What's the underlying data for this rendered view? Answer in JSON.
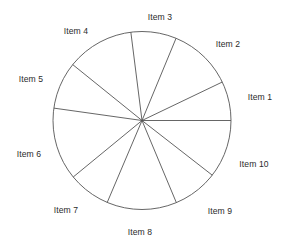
{
  "chart_data": {
    "type": "pie",
    "title": "",
    "subtitle": "",
    "xlabel": "",
    "ylabel": "",
    "legend_position": "none",
    "grid": false,
    "labels_outside": true,
    "stroke_color": "#555555",
    "fill_color": "#ffffff",
    "background": "#ffffff",
    "center": {
      "x": 142,
      "y": 120.5
    },
    "radius": 89,
    "start_angle_deg": 0,
    "direction": "counterclockwise",
    "categories": [
      "Item 1",
      "Item 2",
      "Item 3",
      "Item 4",
      "Item 5",
      "Item 6",
      "Item 7",
      "Item 8",
      "Item 9",
      "Item 10"
    ],
    "values": [
      7.1,
      11.6,
      8.2,
      12.2,
      8.6,
      13.2,
      7.7,
      12.7,
      8.2,
      10.5
    ],
    "slice_angles_deg": [
      25.6,
      41.9,
      29.7,
      43.9,
      30.9,
      47.4,
      27.6,
      45.7,
      29.4,
      37.9
    ],
    "boundary_angles_deg": [
      0,
      25.6,
      67.5,
      97.2,
      141.1,
      172.0,
      219.4,
      247.0,
      292.7,
      322.1,
      360
    ],
    "slices": [
      {
        "label": "Item 1",
        "start_deg": 0,
        "end_deg": 25.6,
        "value": 7.1,
        "label_x": 260,
        "label_y": 97
      },
      {
        "label": "Item 2",
        "start_deg": 25.6,
        "end_deg": 67.5,
        "value": 11.6,
        "label_x": 228,
        "label_y": 44
      },
      {
        "label": "Item 3",
        "start_deg": 67.5,
        "end_deg": 97.2,
        "value": 8.2,
        "label_x": 160,
        "label_y": 17
      },
      {
        "label": "Item 4",
        "start_deg": 97.2,
        "end_deg": 141.1,
        "value": 12.2,
        "label_x": 76,
        "label_y": 31
      },
      {
        "label": "Item 5",
        "start_deg": 141.1,
        "end_deg": 172.0,
        "value": 8.6,
        "label_x": 31,
        "label_y": 79
      },
      {
        "label": "Item 6",
        "start_deg": 172.0,
        "end_deg": 219.4,
        "value": 13.2,
        "label_x": 29,
        "label_y": 154
      },
      {
        "label": "Item 7",
        "start_deg": 219.4,
        "end_deg": 247.0,
        "value": 7.7,
        "label_x": 66,
        "label_y": 210
      },
      {
        "label": "Item 8",
        "start_deg": 247.0,
        "end_deg": 292.7,
        "value": 12.7,
        "label_x": 140,
        "label_y": 232
      },
      {
        "label": "Item 9",
        "start_deg": 292.7,
        "end_deg": 322.1,
        "value": 8.2,
        "label_x": 220,
        "label_y": 211
      },
      {
        "label": "Item 10",
        "start_deg": 322.1,
        "end_deg": 360,
        "value": 10.5,
        "label_x": 254,
        "label_y": 164
      }
    ]
  }
}
